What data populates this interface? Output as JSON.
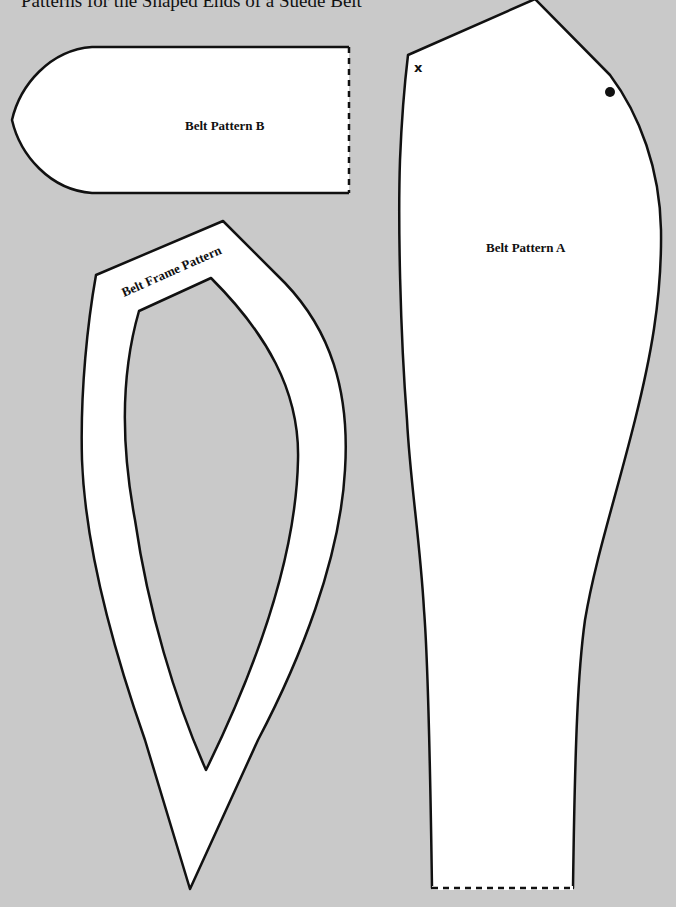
{
  "title": "Patterns for the Shaped Ends of a Suede Belt",
  "colors": {
    "background": "#c9c9c9",
    "pattern_fill": "#ffffff",
    "outline": "#111111"
  },
  "patterns": [
    {
      "id": "belt-pattern-b",
      "label": "Belt Pattern B",
      "notes": "Dashed straight edge on the right side (fold/cut line)"
    },
    {
      "id": "belt-frame-pattern",
      "label": "Belt Frame Pattern",
      "notes": "Frame shape with pointed bottom and cut-out center"
    },
    {
      "id": "belt-pattern-a",
      "label": "Belt Pattern A",
      "notes": "Dashed straight edge at bottom",
      "markers": [
        {
          "type": "x",
          "label": "x"
        },
        {
          "type": "dot",
          "label": "●"
        }
      ]
    }
  ]
}
